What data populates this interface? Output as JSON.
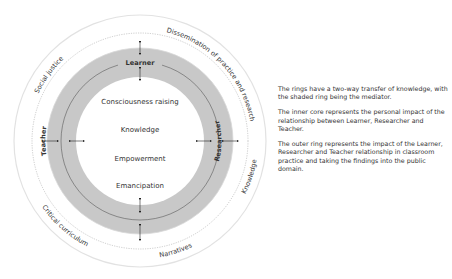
{
  "diagram": {
    "inner_core": [
      "Consciousness raising",
      "Knowledge",
      "Empowerment",
      "Emancipation"
    ],
    "shaded_ring": {
      "top": "Learner",
      "left": "Teacher",
      "right": "Researcher"
    },
    "outer_ring": {
      "top_left": "Social justice",
      "top_right": "Dissemination of practice and research",
      "left": "Knowledge",
      "bottom_left": "Narratives",
      "bottom_right": "Critical curriculum"
    },
    "colors": {
      "shaded_ring": "#c8c8c8",
      "outer_ring_border": "#e2e2e2",
      "text": "#333333"
    }
  },
  "description": {
    "paragraphs": [
      "The rings have a two-way transfer of knowledge, with the shaded ring being the mediator.",
      "The inner core represents the personal impact of the relationship between Learner, Researcher and Teacher.",
      "The outer ring represents the impact of the Learner, Researcher and Teacher relationship in classroom practice and taking the findings into the public domain."
    ]
  }
}
